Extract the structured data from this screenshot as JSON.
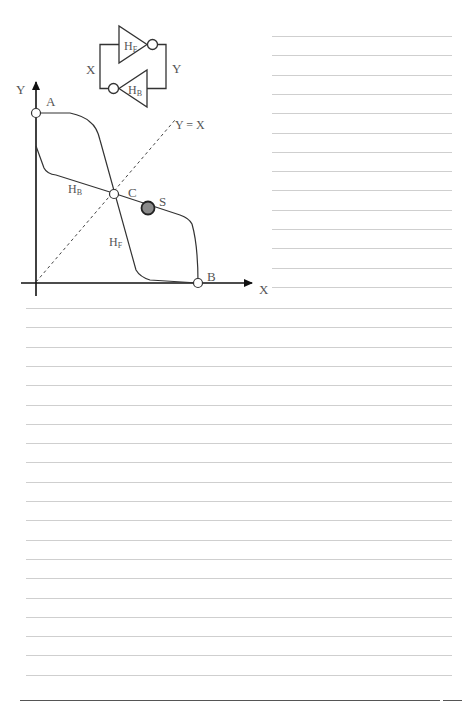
{
  "page": {
    "width": 476,
    "height": 705,
    "background": "#ffffff",
    "rule_color": "#cfcfcf",
    "ruled_lines": {
      "right_column": {
        "x_start": 272,
        "x_end": 452,
        "y_start": 36,
        "spacing": 19.3,
        "count": 14
      },
      "full_width": {
        "x_start": 26,
        "x_end": 452,
        "y_start": 308,
        "spacing": 19.3,
        "count": 20
      }
    },
    "bottom_line": {
      "x_start": 20,
      "x_end": 440,
      "y": 700
    },
    "bottom_mark": {
      "x_start": 443,
      "x_end": 462,
      "y": 700
    }
  },
  "circuit": {
    "gate_forward_label": "H",
    "gate_forward_sub": "F",
    "gate_backward_label": "H",
    "gate_backward_sub": "B",
    "node_x_label": "X",
    "node_y_label": "Y"
  },
  "graph": {
    "y_axis_label": "Y",
    "x_axis_label": "X",
    "diagonal_label": "Y = X",
    "point_a_label": "A",
    "point_b_label": "B",
    "point_c_label": "C",
    "point_s_label": "S",
    "curve_hb_label": "H",
    "curve_hb_sub": "B",
    "curve_hf_label": "H",
    "curve_hf_sub": "F",
    "point_s_fill": "#8a8a8a"
  }
}
